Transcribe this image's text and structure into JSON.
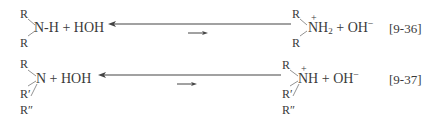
{
  "equations": [
    {
      "number": "[9-36]",
      "left": {
        "top_substituent": "R",
        "bottom_substituent": "R",
        "core": "N-H + HOH"
      },
      "right": {
        "top_substituent": "R",
        "charge": "+",
        "core_main": "NH",
        "core_sub": "2",
        "plus": "+ OH",
        "ion_charge": "−",
        "bottom_substituent": "R"
      }
    },
    {
      "number": "[9-37]",
      "left": {
        "top_substituent": "R",
        "core": "N + HOH",
        "middle_substituent": "R′",
        "bottom_substituent": "R″"
      },
      "right": {
        "top_substituent": "R",
        "charge": "+",
        "core_main": "NH",
        "plus": "+ OH",
        "ion_charge": "−",
        "middle_substituent": "R′",
        "bottom_substituent": "R″"
      }
    }
  ],
  "colors": {
    "ink": "#3a3a3a",
    "background": "#ffffff"
  }
}
